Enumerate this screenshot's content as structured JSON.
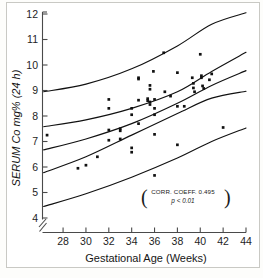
{
  "figure": {
    "background_color": "#ffffff",
    "ink_color": "#111111"
  },
  "chart_data": {
    "type": "scatter",
    "title": "",
    "xlabel": "Gestational Age (Weeks)",
    "ylabel": "SERUM Co mg% (24 h)",
    "xlim": [
      26.2,
      44
    ],
    "ylim": [
      4,
      12
    ],
    "xticks": [
      28,
      30,
      32,
      34,
      36,
      38,
      40,
      42,
      44
    ],
    "xtick_labels": [
      "28",
      "30",
      "32",
      "34",
      "36",
      "38",
      "40",
      "42",
      "44"
    ],
    "yticks": [
      4,
      5,
      6,
      7,
      8,
      9,
      10,
      11,
      12
    ],
    "ytick_labels": [
      "4",
      "5",
      "6",
      "7",
      "8",
      "9",
      "10",
      "11",
      "12"
    ],
    "grid": false,
    "legend": null,
    "y_axis_break": true,
    "points": [
      {
        "x": 26.6,
        "y": 7.25
      },
      {
        "x": 29.3,
        "y": 5.95
      },
      {
        "x": 30.0,
        "y": 6.07
      },
      {
        "x": 31.0,
        "y": 6.4
      },
      {
        "x": 32.0,
        "y": 8.65
      },
      {
        "x": 32.0,
        "y": 8.3
      },
      {
        "x": 32.0,
        "y": 7.45
      },
      {
        "x": 32.0,
        "y": 7.05
      },
      {
        "x": 33.0,
        "y": 7.5
      },
      {
        "x": 33.0,
        "y": 7.42
      },
      {
        "x": 33.0,
        "y": 7.1
      },
      {
        "x": 34.0,
        "y": 8.3
      },
      {
        "x": 34.0,
        "y": 8.05
      },
      {
        "x": 34.0,
        "y": 6.75
      },
      {
        "x": 34.0,
        "y": 6.58
      },
      {
        "x": 34.6,
        "y": 9.5
      },
      {
        "x": 34.6,
        "y": 9.45
      },
      {
        "x": 34.6,
        "y": 8.62
      },
      {
        "x": 34.6,
        "y": 7.7
      },
      {
        "x": 35.4,
        "y": 8.68
      },
      {
        "x": 35.4,
        "y": 8.6
      },
      {
        "x": 35.6,
        "y": 9.2
      },
      {
        "x": 35.6,
        "y": 9.05
      },
      {
        "x": 35.6,
        "y": 8.55
      },
      {
        "x": 35.6,
        "y": 8.45
      },
      {
        "x": 35.9,
        "y": 9.75
      },
      {
        "x": 36.0,
        "y": 8.65
      },
      {
        "x": 36.0,
        "y": 8.3
      },
      {
        "x": 36.0,
        "y": 8.05
      },
      {
        "x": 36.0,
        "y": 7.28
      },
      {
        "x": 36.0,
        "y": 5.67
      },
      {
        "x": 36.8,
        "y": 10.48
      },
      {
        "x": 36.9,
        "y": 8.95
      },
      {
        "x": 37.4,
        "y": 8.78
      },
      {
        "x": 38.0,
        "y": 9.7
      },
      {
        "x": 38.0,
        "y": 8.38
      },
      {
        "x": 38.0,
        "y": 6.87
      },
      {
        "x": 38.6,
        "y": 8.38
      },
      {
        "x": 39.3,
        "y": 9.5
      },
      {
        "x": 39.4,
        "y": 9.28
      },
      {
        "x": 39.4,
        "y": 9.1
      },
      {
        "x": 39.5,
        "y": 8.95
      },
      {
        "x": 40.0,
        "y": 10.42
      },
      {
        "x": 40.1,
        "y": 9.58
      },
      {
        "x": 40.1,
        "y": 9.5
      },
      {
        "x": 40.2,
        "y": 9.18
      },
      {
        "x": 40.3,
        "y": 9.08
      },
      {
        "x": 40.8,
        "y": 9.42
      },
      {
        "x": 41.0,
        "y": 9.65
      },
      {
        "x": 42.0,
        "y": 7.55
      }
    ],
    "curves": [
      {
        "name": "upper-outer-band",
        "points": [
          [
            26.3,
            8.95
          ],
          [
            30,
            9.25
          ],
          [
            34,
            9.85
          ],
          [
            38,
            10.75
          ],
          [
            41,
            11.6
          ],
          [
            44,
            12.05
          ]
        ]
      },
      {
        "name": "upper-inner-band",
        "points": [
          [
            26.3,
            7.58
          ],
          [
            30,
            7.85
          ],
          [
            34,
            8.3
          ],
          [
            38,
            8.95
          ],
          [
            41,
            9.75
          ],
          [
            44,
            10.5
          ]
        ]
      },
      {
        "name": "regression-line",
        "points": [
          [
            26.3,
            6.67
          ],
          [
            30,
            7.1
          ],
          [
            34,
            7.7
          ],
          [
            38,
            8.5
          ],
          [
            41,
            9.2
          ],
          [
            44,
            9.78
          ]
        ]
      },
      {
        "name": "lower-inner-band",
        "points": [
          [
            26.3,
            5.78
          ],
          [
            30,
            6.4
          ],
          [
            34,
            7.25
          ],
          [
            38,
            8.1
          ],
          [
            41,
            8.7
          ],
          [
            44,
            8.97
          ]
        ]
      },
      {
        "name": "lower-outer-band",
        "points": [
          [
            26.3,
            4.45
          ],
          [
            30,
            4.95
          ],
          [
            34,
            5.6
          ],
          [
            38,
            6.35
          ],
          [
            41,
            7.0
          ],
          [
            44,
            7.53
          ]
        ]
      }
    ],
    "annotation": {
      "line1": "CORR. COEFF. 0.495",
      "line2": "p < 0.01",
      "bracket_left": "(",
      "bracket_right": ")"
    }
  }
}
